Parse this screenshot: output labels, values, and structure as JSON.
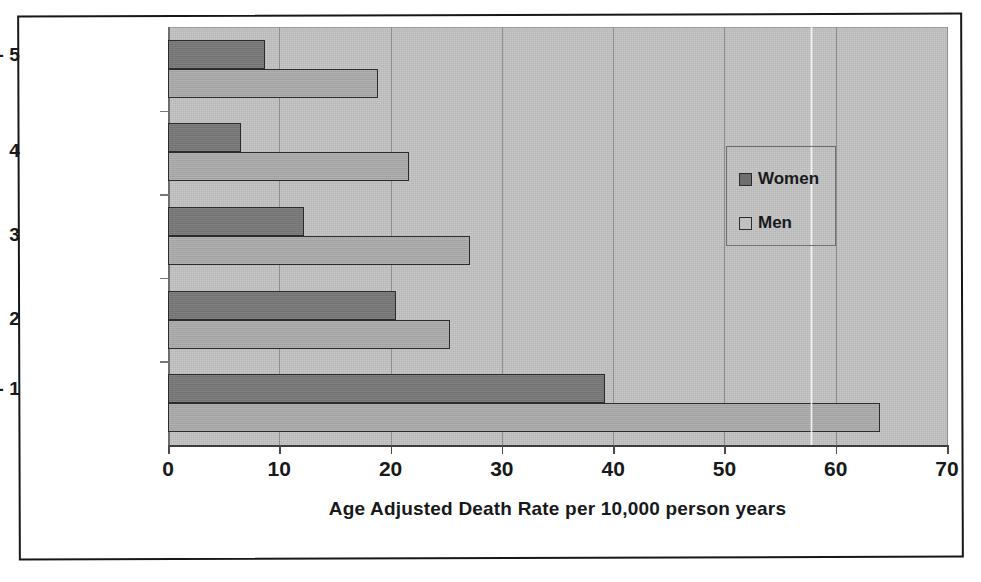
{
  "chart_data": {
    "type": "bar",
    "orientation": "horizontal",
    "title": "",
    "xlabel": "Age Adjusted Death Rate per 10,000 person years",
    "ylabel": "",
    "categories": [
      "High Fitness - 5",
      "4",
      "3",
      "2",
      "Low Fitness - 1"
    ],
    "series": [
      {
        "name": "Women",
        "color": "#787878",
        "values": [
          8.7,
          6.6,
          12.2,
          20.5,
          39.3
        ]
      },
      {
        "name": "Men",
        "color": "#ababab",
        "values": [
          18.9,
          21.7,
          27.1,
          25.3,
          64.0
        ]
      }
    ],
    "xlim": [
      0,
      70
    ],
    "xticks": [
      0,
      10,
      20,
      30,
      40,
      50,
      60,
      70
    ],
    "xtick_labels": [
      "0",
      "10",
      "20",
      "30",
      "40",
      "50",
      "60",
      "70"
    ],
    "grid": "vertical",
    "legend_position": "inside-right",
    "plot_background": "#c2c2c2"
  },
  "legend": {
    "entries": [
      {
        "label": "Women",
        "swatch": "women"
      },
      {
        "label": "Men",
        "swatch": "men"
      }
    ]
  },
  "caption": {
    "text": ""
  }
}
